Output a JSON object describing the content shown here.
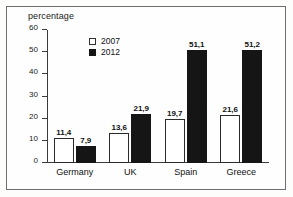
{
  "chart_data": {
    "type": "bar",
    "title": "percentage",
    "xlabel": "",
    "ylabel": "",
    "ylim": [
      0,
      60
    ],
    "yticks": [
      0,
      10,
      20,
      30,
      40,
      50,
      60
    ],
    "ytick_labels": [
      "0",
      "10",
      "20",
      "30",
      "40",
      "50",
      "60"
    ],
    "grid": false,
    "legend_position": "upper-left-inside",
    "categories": [
      "Germany",
      "UK",
      "Spain",
      "Greece"
    ],
    "series": [
      {
        "name": "2007",
        "color": "#ffffff",
        "edge_color": "#2a2a2a",
        "values": [
          11.4,
          13.6,
          19.7,
          21.6
        ],
        "value_labels": [
          "11,4",
          "13,6",
          "19,7",
          "21,6"
        ]
      },
      {
        "name": "2012",
        "color": "#151515",
        "edge_color": "#151515",
        "values": [
          7.9,
          21.9,
          51.1,
          51.2
        ],
        "value_labels": [
          "7,9",
          "21,9",
          "51,1",
          "51,2"
        ]
      }
    ]
  }
}
